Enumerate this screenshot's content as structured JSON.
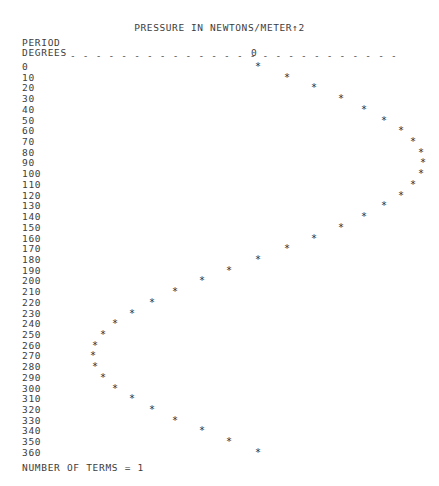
{
  "page": {
    "title": "PRESSURE IN NEWTONS/METER↑2",
    "period_label": "PERIOD",
    "degrees_label": "DEGREES",
    "axis_zero_label": "0",
    "axis_dash_char": "-",
    "point_char": "*",
    "footer": "NUMBER OF TERMS = 1",
    "ink_color": "#3d3d3d",
    "background_color": "#ffffff"
  },
  "chart_data": {
    "type": "scatter",
    "title": "PRESSURE IN NEWTONS/METER↑2",
    "xlabel": "PRESSURE IN NEWTONS/METER↑2",
    "ylabel": "PERIOD DEGREES",
    "orientation": "vertical-axis-is-degrees",
    "axis_zero_x": 255,
    "amplitude_px": 165,
    "grid": false,
    "legend": null,
    "annotations": [
      "NUMBER OF TERMS = 1"
    ],
    "number_of_terms": 1,
    "categories": [
      "0",
      "10",
      "20",
      "30",
      "40",
      "50",
      "60",
      "70",
      "80",
      "90",
      "100",
      "110",
      "120",
      "130",
      "140",
      "150",
      "160",
      "170",
      "180",
      "190",
      "200",
      "210",
      "220",
      "230",
      "240",
      "250",
      "260",
      "270",
      "280",
      "290",
      "300",
      "310",
      "320",
      "330",
      "340",
      "350",
      "360"
    ],
    "degrees": [
      0,
      10,
      20,
      30,
      40,
      50,
      60,
      70,
      80,
      90,
      100,
      110,
      120,
      130,
      140,
      150,
      160,
      170,
      180,
      190,
      200,
      210,
      220,
      230,
      240,
      250,
      260,
      270,
      280,
      290,
      300,
      310,
      320,
      330,
      340,
      350,
      360
    ],
    "values": [
      0.0,
      0.174,
      0.342,
      0.5,
      0.643,
      0.766,
      0.866,
      0.94,
      0.985,
      1.0,
      0.985,
      0.94,
      0.866,
      0.766,
      0.643,
      0.5,
      0.342,
      0.174,
      0.0,
      -0.174,
      -0.342,
      -0.5,
      -0.643,
      -0.766,
      -0.866,
      -0.94,
      -0.985,
      -1.0,
      -0.985,
      -0.94,
      -0.866,
      -0.766,
      -0.643,
      -0.5,
      -0.342,
      -0.174,
      0.0
    ],
    "point_x_px": [
      255,
      284,
      311,
      338,
      361,
      381,
      398,
      410,
      418,
      420,
      418,
      410,
      398,
      381,
      361,
      338,
      311,
      284,
      255,
      226,
      199,
      172,
      149,
      129,
      112,
      100,
      92,
      90,
      92,
      100,
      112,
      129,
      149,
      172,
      199,
      226,
      255
    ]
  },
  "rows": [
    {
      "label": "0",
      "deg": 0,
      "value": 0.0,
      "x": 255
    },
    {
      "label": "10",
      "deg": 10,
      "value": 0.174,
      "x": 284
    },
    {
      "label": "20",
      "deg": 20,
      "value": 0.342,
      "x": 311
    },
    {
      "label": "30",
      "deg": 30,
      "value": 0.5,
      "x": 338
    },
    {
      "label": "40",
      "deg": 40,
      "value": 0.643,
      "x": 361
    },
    {
      "label": "50",
      "deg": 50,
      "value": 0.766,
      "x": 381
    },
    {
      "label": "60",
      "deg": 60,
      "value": 0.866,
      "x": 398
    },
    {
      "label": "70",
      "deg": 70,
      "value": 0.94,
      "x": 410
    },
    {
      "label": "80",
      "deg": 80,
      "value": 0.985,
      "x": 418
    },
    {
      "label": "90",
      "deg": 90,
      "value": 1.0,
      "x": 420
    },
    {
      "label": "100",
      "deg": 100,
      "value": 0.985,
      "x": 418
    },
    {
      "label": "110",
      "deg": 110,
      "value": 0.94,
      "x": 410
    },
    {
      "label": "120",
      "deg": 120,
      "value": 0.866,
      "x": 398
    },
    {
      "label": "130",
      "deg": 130,
      "value": 0.766,
      "x": 381
    },
    {
      "label": "140",
      "deg": 140,
      "value": 0.643,
      "x": 361
    },
    {
      "label": "150",
      "deg": 150,
      "value": 0.5,
      "x": 338
    },
    {
      "label": "160",
      "deg": 160,
      "value": 0.342,
      "x": 311
    },
    {
      "label": "170",
      "deg": 170,
      "value": 0.174,
      "x": 284
    },
    {
      "label": "180",
      "deg": 180,
      "value": 0.0,
      "x": 255
    },
    {
      "label": "190",
      "deg": 190,
      "value": -0.174,
      "x": 226
    },
    {
      "label": "200",
      "deg": 200,
      "value": -0.342,
      "x": 199
    },
    {
      "label": "210",
      "deg": 210,
      "value": -0.5,
      "x": 172
    },
    {
      "label": "220",
      "deg": 220,
      "value": -0.643,
      "x": 149
    },
    {
      "label": "230",
      "deg": 230,
      "value": -0.766,
      "x": 129
    },
    {
      "label": "240",
      "deg": 240,
      "value": -0.866,
      "x": 112
    },
    {
      "label": "250",
      "deg": 250,
      "value": -0.94,
      "x": 100
    },
    {
      "label": "260",
      "deg": 260,
      "value": -0.985,
      "x": 92
    },
    {
      "label": "270",
      "deg": 270,
      "value": -1.0,
      "x": 90
    },
    {
      "label": "280",
      "deg": 280,
      "value": -0.985,
      "x": 92
    },
    {
      "label": "290",
      "deg": 290,
      "value": -0.94,
      "x": 100
    },
    {
      "label": "300",
      "deg": 300,
      "value": -0.866,
      "x": 112
    },
    {
      "label": "310",
      "deg": 310,
      "value": -0.766,
      "x": 129
    },
    {
      "label": "320",
      "deg": 320,
      "value": -0.643,
      "x": 149
    },
    {
      "label": "330",
      "deg": 330,
      "value": -0.5,
      "x": 172
    },
    {
      "label": "340",
      "deg": 340,
      "value": -0.342,
      "x": 199
    },
    {
      "label": "350",
      "deg": 350,
      "value": -0.174,
      "x": 226
    },
    {
      "label": "360",
      "deg": 360,
      "value": 0.0,
      "x": 255
    }
  ]
}
